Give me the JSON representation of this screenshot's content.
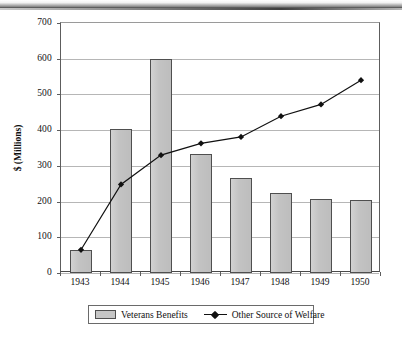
{
  "chart_data": {
    "type": "bar",
    "title": "",
    "xlabel": "",
    "ylabel": "$ (Millions)",
    "ylim": [
      0,
      700
    ],
    "ytick_step": 100,
    "yticks": [
      "0",
      "100",
      "200",
      "300",
      "400",
      "500",
      "600",
      "700"
    ],
    "grid": true,
    "legend_position": "bottom",
    "categories": [
      "1943",
      "1944",
      "1945",
      "1946",
      "1947",
      "1948",
      "1949",
      "1950"
    ],
    "series": [
      {
        "name": "Veterans Benefits",
        "type": "bar",
        "color": "#c6c6c6",
        "edge_color": "#4f4f4f",
        "values": [
          65,
          404,
          600,
          333,
          267,
          224,
          207,
          204
        ]
      },
      {
        "name": "Other Source of Welfare",
        "type": "line",
        "color": "#111111",
        "marker": "diamond",
        "values": [
          65,
          248,
          330,
          363,
          381,
          439,
          472,
          540
        ]
      }
    ]
  },
  "legend": {
    "bar_label": "Veterans Benefits",
    "line_label": "Other Source of Welfare",
    "bar_swatch_icon": "filled-rectangle-icon",
    "line_swatch_icon": "line-with-diamond-marker-icon"
  },
  "axes": {
    "y_title": "$ (Millions)"
  }
}
